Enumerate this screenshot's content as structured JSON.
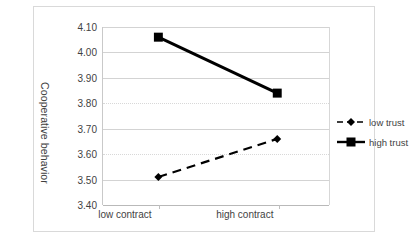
{
  "chart_data": {
    "type": "line",
    "title": "",
    "xlabel": "",
    "ylabel": "Cooperative behavior",
    "categories": [
      "low contract",
      "high contract"
    ],
    "ylim": [
      3.4,
      4.1
    ],
    "yticks": [
      "3.40",
      "3.50",
      "3.60",
      "3.70",
      "3.80",
      "3.90",
      "4.00",
      "4.10"
    ],
    "ytick_values": [
      3.4,
      3.5,
      3.6,
      3.7,
      3.8,
      3.9,
      4.0,
      4.1
    ],
    "grid": true,
    "legend_position": "right",
    "series": [
      {
        "name": "low trust",
        "values": [
          3.51,
          3.66
        ],
        "line_style": "dashed",
        "marker": "diamond",
        "color": "#000000"
      },
      {
        "name": "high trust",
        "values": [
          4.06,
          3.84
        ],
        "line_style": "solid",
        "marker": "square",
        "color": "#000000"
      }
    ]
  },
  "legend": {
    "items": [
      {
        "label": "low trust",
        "style": "dashed-diamond"
      },
      {
        "label": "high trust",
        "style": "solid-square"
      }
    ]
  },
  "colors": {
    "line": "#000000",
    "grid": "#d3d3d3",
    "axis": "#b9b9b9",
    "frame": "#d9d9d9",
    "text": "#3f3f3f",
    "background": "#ffffff"
  }
}
